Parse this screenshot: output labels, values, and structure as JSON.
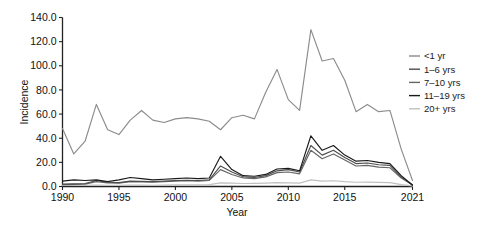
{
  "chart_data": {
    "type": "line",
    "title": "",
    "xlabel": "Year",
    "ylabel": "Incidence",
    "xlim": [
      1990,
      2021
    ],
    "ylim": [
      0.0,
      140.0
    ],
    "grid": false,
    "legend_position": "right",
    "x": [
      1990,
      1991,
      1992,
      1993,
      1994,
      1995,
      1996,
      1997,
      1998,
      1999,
      2000,
      2001,
      2002,
      2003,
      2004,
      2005,
      2006,
      2007,
      2008,
      2009,
      2010,
      2011,
      2012,
      2013,
      2014,
      2015,
      2016,
      2017,
      2018,
      2019,
      2020,
      2021
    ],
    "xtick_labels": [
      "1990",
      "1995",
      "2000",
      "2005",
      "2010",
      "2015",
      "2021"
    ],
    "xticks": [
      1990,
      1995,
      2000,
      2005,
      2010,
      2015,
      2021
    ],
    "ytick_labels": [
      "0.0",
      "20.0",
      "40.0",
      "60.0",
      "80.0",
      "100.0",
      "120.0",
      "140.0"
    ],
    "yticks": [
      0.0,
      20.0,
      40.0,
      60.0,
      80.0,
      100.0,
      120.0,
      140.0
    ],
    "series": [
      {
        "name": "<1 yr",
        "color": "#8c8c8c",
        "values": [
          48.0,
          27.0,
          37.5,
          68.0,
          47.0,
          43.0,
          55.0,
          63.0,
          55.0,
          53.0,
          56.0,
          57.0,
          56.0,
          54.0,
          47.0,
          57.0,
          59.0,
          56.0,
          78.0,
          97.0,
          72.0,
          63.0,
          130.0,
          104.0,
          106.0,
          88.0,
          62.0,
          68.0,
          62.0,
          63.0,
          31.0,
          5.0
        ]
      },
      {
        "name": "1-6 yrs",
        "color": "#4d4d4d",
        "values": [
          2.0,
          2.2,
          2.5,
          5.0,
          3.5,
          3.2,
          4.5,
          4.2,
          4.0,
          4.5,
          5.0,
          5.2,
          5.0,
          5.5,
          17.0,
          12.0,
          8.0,
          7.5,
          9.0,
          13.0,
          14.0,
          12.0,
          34.0,
          26.0,
          30.0,
          24.0,
          19.0,
          19.5,
          18.0,
          17.5,
          8.0,
          1.5
        ]
      },
      {
        "name": "7-10 yrs",
        "color": "#666666",
        "values": [
          1.5,
          1.8,
          2.0,
          4.0,
          3.0,
          2.8,
          4.0,
          3.8,
          3.5,
          4.0,
          4.5,
          4.8,
          4.5,
          5.0,
          14.0,
          10.0,
          7.0,
          6.5,
          8.0,
          11.5,
          12.0,
          10.5,
          30.0,
          23.0,
          27.0,
          22.0,
          17.0,
          17.5,
          16.0,
          15.5,
          7.0,
          1.2
        ]
      },
      {
        "name": "11-19 yrs",
        "color": "#1a1a1a",
        "values": [
          4.5,
          5.5,
          5.0,
          5.5,
          4.0,
          5.5,
          7.5,
          6.5,
          5.5,
          6.0,
          6.5,
          7.0,
          6.5,
          7.0,
          25.0,
          14.0,
          9.0,
          8.5,
          10.0,
          14.5,
          15.0,
          13.0,
          42.0,
          30.0,
          34.0,
          26.0,
          21.0,
          21.5,
          20.0,
          19.0,
          9.0,
          1.0
        ]
      },
      {
        "name": "20+ yrs",
        "color": "#c0c0c0",
        "values": [
          0.8,
          0.9,
          1.0,
          1.2,
          1.0,
          1.0,
          1.2,
          1.1,
          1.0,
          1.1,
          1.3,
          1.4,
          1.3,
          1.5,
          3.0,
          2.8,
          2.5,
          2.6,
          2.8,
          3.2,
          3.0,
          2.8,
          5.5,
          4.5,
          4.8,
          4.0,
          3.5,
          3.6,
          3.4,
          3.2,
          1.6,
          0.5
        ]
      }
    ]
  },
  "legend": {
    "entries": [
      {
        "label": "<1 yr"
      },
      {
        "label": "1–6 yrs"
      },
      {
        "label": "7–10 yrs"
      },
      {
        "label": "11–19 yrs"
      },
      {
        "label": "20+ yrs"
      }
    ]
  }
}
